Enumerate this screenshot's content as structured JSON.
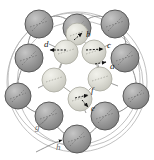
{
  "figure": {
    "type": "molecular-cluster-diagram",
    "title": "",
    "canvas": {
      "width": 154,
      "height": 160,
      "background": "#ffffff"
    },
    "palette": {
      "outer_sphere_fill": "#9c9c9c",
      "outer_sphere_edge": "#4a4a4a",
      "outer_sphere_highlight": "#c2c2c2",
      "inner_sphere_fill": "#dcdcd4",
      "inner_sphere_edge": "#a8a8a0",
      "inner_sphere_highlight": "#efefe8",
      "bond_line": "#8a8a8a",
      "ring_line": "#b4b4b4",
      "arrow": "#111111",
      "label_text": "#1b1b1b"
    },
    "counts": {
      "outer_spheres": 9,
      "inner_spheres": 7,
      "arrow_labels": 6,
      "leader_labels": 2,
      "outer_ring_arcs": 3
    }
  },
  "outer_spheres": [
    {
      "id": "o1",
      "cx": 39,
      "cy": 24,
      "r": 14
    },
    {
      "id": "o2",
      "cx": 77,
      "cy": 28,
      "r": 14
    },
    {
      "id": "o3",
      "cx": 115,
      "cy": 24,
      "r": 14
    },
    {
      "id": "o4",
      "cx": 29,
      "cy": 58,
      "r": 14
    },
    {
      "id": "o5",
      "cx": 125,
      "cy": 58,
      "r": 14
    },
    {
      "id": "o6",
      "cx": 18,
      "cy": 96,
      "r": 13
    },
    {
      "id": "o7",
      "cx": 136,
      "cy": 96,
      "r": 13
    },
    {
      "id": "o8",
      "cx": 49,
      "cy": 116,
      "r": 14
    },
    {
      "id": "o9",
      "cx": 105,
      "cy": 116,
      "r": 14
    },
    {
      "id": "o10",
      "cx": 77,
      "cy": 139,
      "r": 14
    }
  ],
  "inner_spheres": [
    {
      "id": "i1",
      "cx": 66,
      "cy": 52,
      "r": 12
    },
    {
      "id": "i2",
      "cx": 94,
      "cy": 52,
      "r": 12
    },
    {
      "id": "i3",
      "cx": 100,
      "cy": 79,
      "r": 12
    },
    {
      "id": "i4",
      "cx": 80,
      "cy": 99,
      "r": 12
    },
    {
      "id": "i5",
      "cx": 54,
      "cy": 80,
      "r": 12
    },
    {
      "id": "i6",
      "cx": 77,
      "cy": 34,
      "r": 11
    }
  ],
  "arrow_labels": [
    {
      "key": "a",
      "text": "a",
      "x": 110,
      "y": 68
    },
    {
      "key": "b",
      "text": "b",
      "x": 86,
      "y": 36
    },
    {
      "key": "c",
      "text": "c",
      "x": 107,
      "y": 47
    },
    {
      "key": "d",
      "text": "d",
      "x": 44,
      "y": 46
    },
    {
      "key": "e",
      "text": "e",
      "x": 91,
      "y": 110
    },
    {
      "key": "f",
      "text": "f",
      "x": 91,
      "y": 92
    }
  ],
  "leader_labels": [
    {
      "key": "g",
      "text": "g",
      "x": 35,
      "y": 128
    },
    {
      "key": "h",
      "text": "h",
      "x": 56,
      "y": 148
    }
  ],
  "accessibility": {
    "description": "Schematic of a ring cluster: nine large shaded spheres form an outer ring, six to seven lighter spheres form an inner ring, with black arrows labelled a through f marking displacement directions, and leader lines labelled g and h pointing to outer ring arcs."
  }
}
